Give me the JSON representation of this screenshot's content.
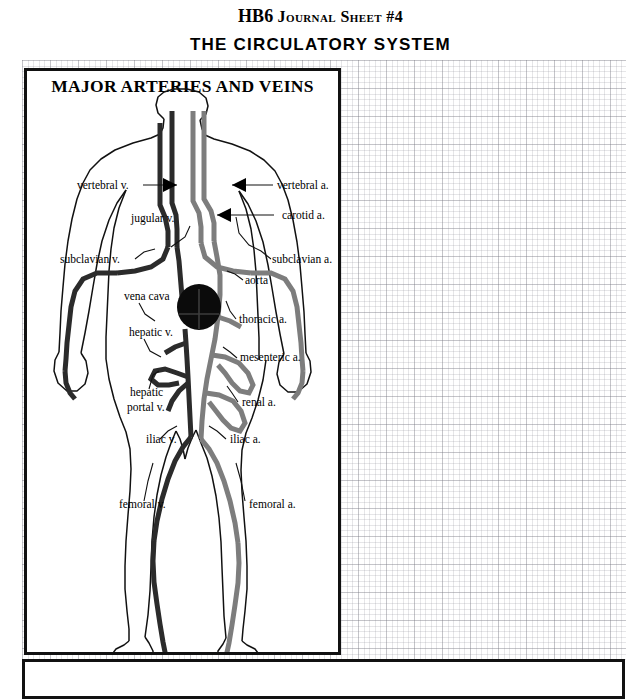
{
  "header": {
    "code": "HB6",
    "sheet": "Journal Sheet #4",
    "subtitle": "THE CIRCULATORY SYSTEM"
  },
  "diagram": {
    "heading": "MAJOR ARTERIES AND VEINS",
    "colors": {
      "vein": "#2b2b2b",
      "artery": "#7d7d7d",
      "heart": "#0b0b0b",
      "outline": "#111111",
      "border": "#111111",
      "grid": "#78788a"
    },
    "labels": [
      {
        "id": "vertebral-v",
        "text": "vertebral v.",
        "x": 50,
        "y": 118,
        "anchor": "start"
      },
      {
        "id": "vertebral-a",
        "text": "vertebral a.",
        "x": 250,
        "y": 118,
        "anchor": "start"
      },
      {
        "id": "jugular-v",
        "text": "jugular v.",
        "x": 104,
        "y": 151,
        "anchor": "start"
      },
      {
        "id": "carotid-a",
        "text": "carotid a.",
        "x": 255,
        "y": 148,
        "anchor": "start"
      },
      {
        "id": "subclavian-v",
        "text": "subclavian v.",
        "x": 33,
        "y": 192,
        "anchor": "start"
      },
      {
        "id": "subclavian-a",
        "text": "subclavian a.",
        "x": 245,
        "y": 192,
        "anchor": "start"
      },
      {
        "id": "aorta",
        "text": "aorta",
        "x": 218,
        "y": 213,
        "anchor": "start"
      },
      {
        "id": "vena-cava",
        "text": "vena cava",
        "x": 97,
        "y": 229,
        "anchor": "start"
      },
      {
        "id": "thoracic-a",
        "text": "thoracic a.",
        "x": 212,
        "y": 252,
        "anchor": "start"
      },
      {
        "id": "hepatic-v",
        "text": "hepatic v.",
        "x": 102,
        "y": 265,
        "anchor": "start"
      },
      {
        "id": "mesenteric-a",
        "text": "mesenteric a.",
        "x": 213,
        "y": 290,
        "anchor": "start"
      },
      {
        "id": "hepatic",
        "text": "hepatic",
        "x": 103,
        "y": 325,
        "anchor": "start"
      },
      {
        "id": "portal-v",
        "text": "portal v.",
        "x": 100,
        "y": 340,
        "anchor": "start"
      },
      {
        "id": "renal-a",
        "text": "renal a.",
        "x": 215,
        "y": 335,
        "anchor": "start"
      },
      {
        "id": "iliac-v",
        "text": "iliac v.",
        "x": 119,
        "y": 372,
        "anchor": "start"
      },
      {
        "id": "iliac-a",
        "text": "iliac a.",
        "x": 203,
        "y": 372,
        "anchor": "start"
      },
      {
        "id": "femoral-v",
        "text": "femoral v.",
        "x": 92,
        "y": 437,
        "anchor": "start"
      },
      {
        "id": "femoral-a",
        "text": "femoral a.",
        "x": 222,
        "y": 437,
        "anchor": "start"
      }
    ]
  }
}
